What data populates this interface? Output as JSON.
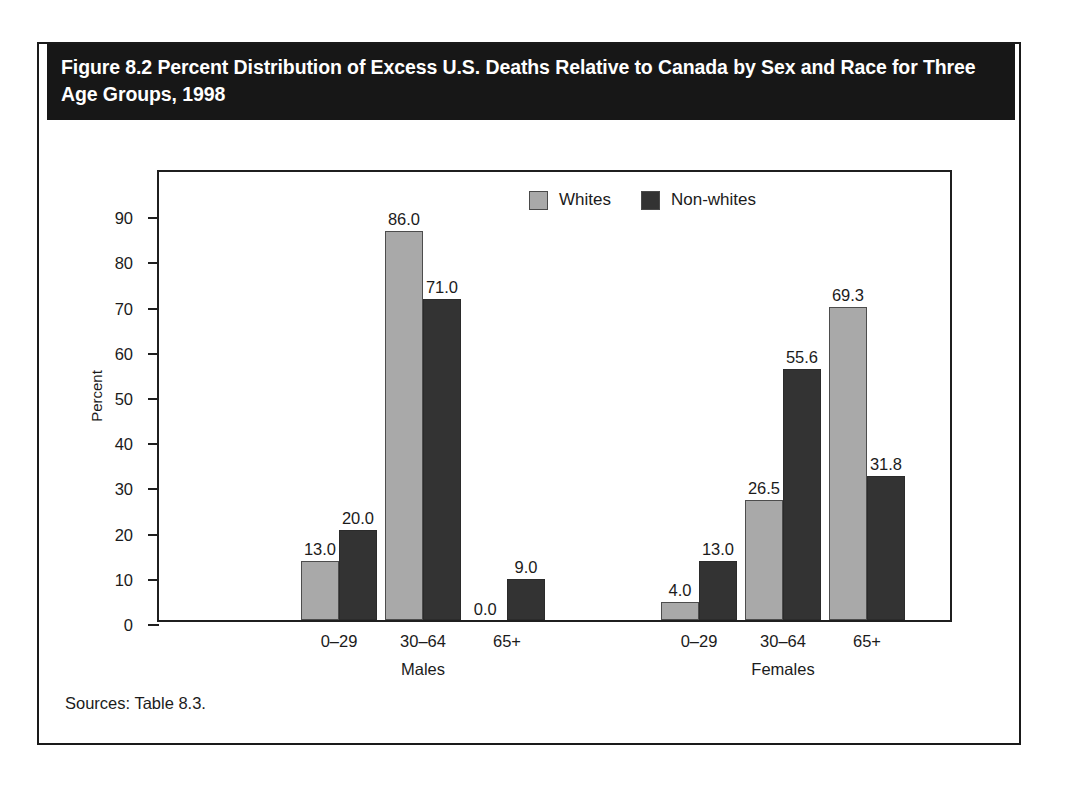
{
  "figure": {
    "title": "Figure 8.2 Percent Distribution of Excess U.S. Deaths Relative to Canada by Sex and Race for Three Age Groups, 1998",
    "source_note": "Sources: Table 8.3."
  },
  "colors": {
    "whites": "#a9a9a9",
    "nonwhites": "#333333",
    "banner_bg": "#171717",
    "banner_text": "#ffffff",
    "axis": "#1f1f1f",
    "page_bg": "#ffffff"
  },
  "legend": {
    "entries": [
      {
        "label": "Whites",
        "swatch": "whites"
      },
      {
        "label": "Non-whites",
        "swatch": "nonwhites"
      }
    ]
  },
  "chart_data": {
    "type": "bar",
    "title": "Figure 8.2 Percent Distribution of Excess U.S. Deaths Relative to Canada by Sex and Race for Three Age Groups, 1998",
    "xlabel": "",
    "ylabel": "Percent",
    "ylim": [
      0,
      100
    ],
    "yticks": [
      0,
      10,
      20,
      30,
      40,
      50,
      60,
      70,
      80,
      90
    ],
    "ytick_labels": [
      "0",
      "10",
      "20",
      "30",
      "40",
      "50",
      "60",
      "70",
      "80",
      "90"
    ],
    "grid": false,
    "legend_position": "top-center",
    "data_labels": true,
    "data_label_format": "one-decimal",
    "groups": [
      {
        "name": "Males",
        "categories": [
          "0–29",
          "30–64",
          "65+"
        ]
      },
      {
        "name": "Females",
        "categories": [
          "0–29",
          "30–64",
          "65+"
        ]
      }
    ],
    "categories": [
      "0–29",
      "30–64",
      "65+",
      "0–29",
      "30–64",
      "65+"
    ],
    "series": [
      {
        "name": "Whites",
        "values": [
          13.0,
          86.0,
          0.0,
          4.0,
          26.5,
          69.3
        ]
      },
      {
        "name": "Non-whites",
        "values": [
          20.0,
          71.0,
          9.0,
          13.0,
          55.6,
          31.8
        ]
      }
    ],
    "bars": [
      {
        "group": "Males",
        "category": "0–29",
        "series": "Whites",
        "value": 13.0,
        "label": "13.0"
      },
      {
        "group": "Males",
        "category": "0–29",
        "series": "Non-whites",
        "value": 20.0,
        "label": "20.0"
      },
      {
        "group": "Males",
        "category": "30–64",
        "series": "Whites",
        "value": 86.0,
        "label": "86.0"
      },
      {
        "group": "Males",
        "category": "30–64",
        "series": "Non-whites",
        "value": 71.0,
        "label": "71.0"
      },
      {
        "group": "Males",
        "category": "65+",
        "series": "Whites",
        "value": 0.0,
        "label": "0.0"
      },
      {
        "group": "Males",
        "category": "65+",
        "series": "Non-whites",
        "value": 9.0,
        "label": "9.0"
      },
      {
        "group": "Females",
        "category": "0–29",
        "series": "Whites",
        "value": 4.0,
        "label": "4.0"
      },
      {
        "group": "Females",
        "category": "0–29",
        "series": "Non-whites",
        "value": 13.0,
        "label": "13.0"
      },
      {
        "group": "Females",
        "category": "30–64",
        "series": "Whites",
        "value": 26.5,
        "label": "26.5"
      },
      {
        "group": "Females",
        "category": "30–64",
        "series": "Non-whites",
        "value": 55.6,
        "label": "55.6"
      },
      {
        "group": "Females",
        "category": "65+",
        "series": "Whites",
        "value": 69.3,
        "label": "69.3"
      },
      {
        "group": "Females",
        "category": "65+",
        "series": "Non-whites",
        "value": 31.8,
        "label": "31.8"
      }
    ]
  }
}
